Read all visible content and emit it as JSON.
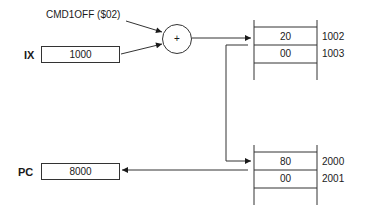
{
  "offset_label": "CMD1OFF ($02)",
  "adder": {
    "symbol": "+"
  },
  "registers": {
    "ix": {
      "name": "IX",
      "value": "1000"
    },
    "pc": {
      "name": "PC",
      "value": "8000"
    }
  },
  "memory_top": {
    "cells": [
      {
        "value": "20",
        "address": "1002"
      },
      {
        "value": "00",
        "address": "1003"
      }
    ]
  },
  "memory_bottom": {
    "cells": [
      {
        "value": "80",
        "address": "2000"
      },
      {
        "value": "00",
        "address": "2001"
      }
    ]
  },
  "colors": {
    "line": "#333333",
    "text": "#1a1a1a",
    "background": "#ffffff"
  }
}
